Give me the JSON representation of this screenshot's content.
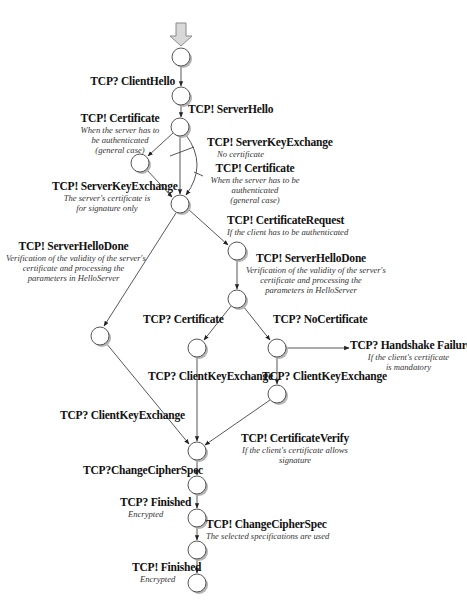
{
  "diagram": {
    "nodes": [
      {
        "id": "n0",
        "x": 181,
        "y": 57
      },
      {
        "id": "n1",
        "x": 181,
        "y": 96
      },
      {
        "id": "n2",
        "x": 180,
        "y": 127
      },
      {
        "id": "n3",
        "x": 140,
        "y": 163
      },
      {
        "id": "n4",
        "x": 180,
        "y": 204
      },
      {
        "id": "n5",
        "x": 237,
        "y": 251
      },
      {
        "id": "n6",
        "x": 237,
        "y": 299
      },
      {
        "id": "n7",
        "x": 100,
        "y": 336
      },
      {
        "id": "n8",
        "x": 197,
        "y": 348
      },
      {
        "id": "n9",
        "x": 277,
        "y": 348
      },
      {
        "id": "n10",
        "x": 277,
        "y": 394
      },
      {
        "id": "n11",
        "x": 197,
        "y": 451
      },
      {
        "id": "n12",
        "x": 197,
        "y": 485
      },
      {
        "id": "n13",
        "x": 197,
        "y": 518
      },
      {
        "id": "n14",
        "x": 197,
        "y": 550
      },
      {
        "id": "n15",
        "x": 197,
        "y": 583
      }
    ],
    "labels": {
      "client_hello": {
        "title": "TCP? ClientHello"
      },
      "server_hello": {
        "title": "TCP! ServerHello"
      },
      "certificate_left": {
        "title": "TCP! Certificate",
        "desc": [
          "When the server has to",
          "be authenticated",
          "(general case)"
        ]
      },
      "server_key_exchange_nocert": {
        "title": "TCP! ServerKeyExchange",
        "desc": [
          "No certificate"
        ]
      },
      "certificate_right": {
        "title": "TCP! Certificate",
        "desc": [
          "When the server has to be",
          "authenticated",
          "(general case)"
        ]
      },
      "server_key_exchange_sig": {
        "title": "TCP! ServerKeyExchange",
        "desc": [
          "The server's certificate is",
          "for signature only"
        ]
      },
      "certificate_request": {
        "title": "TCP! CertificateRequest",
        "desc": [
          "If the client has to be authenticated"
        ]
      },
      "server_hello_done_left": {
        "title": "TCP! ServerHelloDone",
        "desc": [
          "Verification of the validity of the server's",
          "certificate and processing the",
          "parameters in HelloServer"
        ]
      },
      "server_hello_done_right": {
        "title": "TCP! ServerHelloDone",
        "desc": [
          "Verification of the validity of the server's",
          "certificate and processing the",
          "parameters in HelloServer"
        ]
      },
      "client_certificate": {
        "title": "TCP? Certificate"
      },
      "no_certificate": {
        "title": "TCP? NoCertificate"
      },
      "handshake_failure": {
        "title": "TCP? Handshake Failure",
        "desc": [
          "If the client's certificate",
          "is mandatory"
        ]
      },
      "client_key_exchange_mid": {
        "title": "TCP? ClientKeyExchange"
      },
      "client_key_exchange_right": {
        "title": "TCP? ClientKeyExchange"
      },
      "client_key_exchange_left": {
        "title": "TCP? ClientKeyExchange"
      },
      "certificate_verify": {
        "title": "TCP! CertificateVerify",
        "desc": [
          "If the client's certificate allows",
          "signature"
        ]
      },
      "change_cipher_spec_client": {
        "title": "TCP?ChangeCipherSpec"
      },
      "finished_client": {
        "title": "TCP?  Finished",
        "desc": [
          "Encrypted"
        ]
      },
      "change_cipher_spec_server": {
        "title": "TCP! ChangeCipherSpec",
        "desc": [
          "The selected specifications are used"
        ]
      },
      "finished_server": {
        "title": "TCP! Finished",
        "desc": [
          "Encrypted"
        ]
      }
    },
    "colors": {
      "line": "#444444",
      "node_fill": "#ffffff",
      "node_shadow": "#b5b5b5",
      "start_arrow_fill": "#d8d8d8",
      "start_arrow_stroke": "#8a8a8a"
    }
  }
}
